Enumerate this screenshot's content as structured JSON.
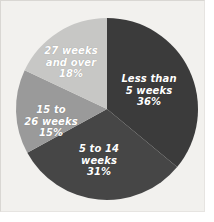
{
  "chart_data": {
    "type": "pie",
    "title": "",
    "subtitle": "",
    "xlabel": "",
    "ylabel": "",
    "legend_position": "none",
    "labels_inside_slices": true,
    "start_angle_deg": 0,
    "direction": "clockwise",
    "units": "percent",
    "total": 100,
    "categories": [
      "Less than 5 weeks",
      "5 to 14 weeks",
      "15 to 26 weeks",
      "27 weeks and over"
    ],
    "values": [
      36,
      31,
      15,
      18
    ],
    "slices": [
      {
        "name": "Less than 5 weeks",
        "label_text": "Less than\n5 weeks",
        "value_text": "36%",
        "value": 36,
        "color": "#3b3b3b",
        "start_deg": 0,
        "end_deg": 129.6
      },
      {
        "name": "5 to 14 weeks",
        "label_text": "5 to 14\nweeks",
        "value_text": "31%",
        "value": 31,
        "color": "#464646",
        "start_deg": 129.6,
        "end_deg": 241.2
      },
      {
        "name": "15 to 26 weeks",
        "label_text": "15 to\n26 weeks",
        "value_text": "15%",
        "value": 15,
        "color": "#9a9a9a",
        "start_deg": 241.2,
        "end_deg": 295.2
      },
      {
        "name": "27 weeks and over",
        "label_text": "27 weeks\nand over",
        "value_text": "18%",
        "value": 18,
        "color": "#c7c7c5",
        "start_deg": 295.2,
        "end_deg": 360
      }
    ],
    "colors": {
      "background": "#f2f1ee",
      "page": "#ffffff",
      "border": "#d9d7d3",
      "label_text": "#ffffff",
      "slice_1": "#3b3b3b",
      "slice_2": "#464646",
      "slice_3": "#9a9a9a",
      "slice_4": "#c7c7c5"
    }
  }
}
